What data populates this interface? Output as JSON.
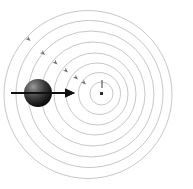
{
  "figure": {
    "background_color": "#ffffff",
    "width": 193,
    "height": 189,
    "caption": ""
  },
  "colors": {
    "wavefront_stroke": "#b9b9b9",
    "small_arrow_fill": "#6f6f6f",
    "velocity_arrow": "#111111",
    "sphere_light": "#8e8e8e",
    "sphere_mid": "#4a4a4a",
    "sphere_dark": "#0f0f0f",
    "center_marker": "#2b2b2b",
    "background": "#ffffff"
  },
  "chart_data": {
    "type": "scatter",
    "xlabel": "",
    "ylabel": "",
    "wavefronts": [
      {
        "index": 1,
        "cx": 101.5,
        "cy": 93.5,
        "r": 11.5
      },
      {
        "index": 2,
        "cx": 99.5,
        "cy": 93.5,
        "r": 21.0
      },
      {
        "index": 3,
        "cx": 97.0,
        "cy": 94.0,
        "r": 31.0
      },
      {
        "index": 4,
        "cx": 95.0,
        "cy": 94.0,
        "r": 41.0
      },
      {
        "index": 5,
        "cx": 93.0,
        "cy": 94.0,
        "r": 52.0
      },
      {
        "index": 6,
        "cx": 91.0,
        "cy": 94.0,
        "r": 63.0
      },
      {
        "index": 7,
        "cx": 89.5,
        "cy": 94.0,
        "r": 73.5
      },
      {
        "index": 8,
        "cx": 88.0,
        "cy": 94.5,
        "r": 84.0
      }
    ],
    "source_sphere": {
      "cx": 38.0,
      "cy": 93.0,
      "r": 14.0
    },
    "velocity_arrow": {
      "x1": 11.0,
      "y1": 93.0,
      "x2": 75.0,
      "y2": 93.0,
      "direction": "right",
      "label": ""
    },
    "center_marker": {
      "cx": 101.5,
      "cy": 93.5,
      "size": 3.0
    },
    "center_tick": {
      "x": 102.0,
      "y1": 80.0,
      "y2": 88.0
    },
    "propagation_arrows": [
      {
        "x": 30.5,
        "y": 41.0,
        "angle_deg": 42
      },
      {
        "x": 45.0,
        "y": 55.0,
        "angle_deg": 42
      },
      {
        "x": 57.5,
        "y": 64.5,
        "angle_deg": 42
      },
      {
        "x": 68.0,
        "y": 72.5,
        "angle_deg": 42
      },
      {
        "x": 78.0,
        "y": 79.5,
        "angle_deg": 42
      },
      {
        "x": 86.0,
        "y": 84.5,
        "angle_deg": 42
      }
    ],
    "grid": false,
    "legend": "none"
  }
}
